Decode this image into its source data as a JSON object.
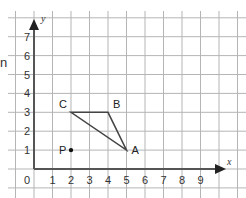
{
  "diagram": {
    "type": "coordinate-grid",
    "origin_label": "0",
    "x_axis": {
      "name": "x",
      "ticks": [
        "1",
        "2",
        "3",
        "4",
        "5",
        "6",
        "7",
        "8",
        "9"
      ]
    },
    "y_axis": {
      "name": "y",
      "ticks": [
        "1",
        "2",
        "3",
        "4",
        "5",
        "6",
        "7"
      ]
    },
    "points": [
      {
        "label": "A",
        "x": 5,
        "y": 1
      },
      {
        "label": "B",
        "x": 4,
        "y": 3
      },
      {
        "label": "C",
        "x": 2,
        "y": 3
      },
      {
        "label": "P",
        "x": 2,
        "y": 1,
        "dot": true
      }
    ],
    "shape": {
      "name": "triangle ABC",
      "vertices": [
        "A",
        "B",
        "C"
      ]
    },
    "clipped_left_text": "n",
    "colors": {
      "grid": "#b5b5b5",
      "axis": "#555555",
      "shape": "#444444",
      "point": "#111111"
    }
  }
}
